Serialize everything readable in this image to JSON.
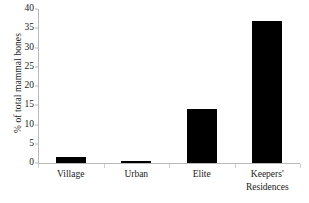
{
  "chart_data": {
    "type": "bar",
    "title": "",
    "xlabel": "",
    "ylabel": "% of total mammal bones",
    "categories": [
      "Village",
      "Urban",
      "Elite",
      "Keepers' Residences"
    ],
    "category_lines": [
      [
        "Village"
      ],
      [
        "Urban"
      ],
      [
        "Elite"
      ],
      [
        "Keepers'",
        "Residences"
      ]
    ],
    "values": [
      1.5,
      0.5,
      14,
      37
    ],
    "ylim": [
      0,
      40
    ],
    "yticks": [
      0,
      5,
      10,
      15,
      20,
      25,
      30,
      35,
      40
    ],
    "ytick_labels": [
      "0",
      "5",
      "10",
      "15",
      "20",
      "25",
      "30",
      "35",
      "40"
    ],
    "grid": false,
    "legend": false,
    "bar_color": "#000000",
    "axis_color": "#b9b9b9",
    "background": "#ffffff"
  }
}
